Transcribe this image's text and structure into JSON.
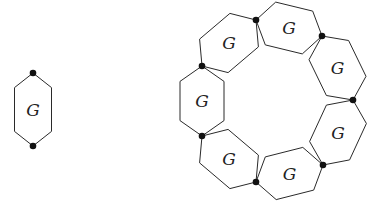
{
  "diagram": {
    "type": "graph-composition",
    "single_block": {
      "label": "G",
      "top_vertex": [
        33,
        73
      ],
      "bottom_vertex": [
        33,
        146
      ],
      "half_width": 18.5
    },
    "ring": {
      "block_label": "G",
      "block_count": 7,
      "half_width": 22,
      "vertices": [
        [
          256,
          20
        ],
        [
          322,
          36
        ],
        [
          353,
          100
        ],
        [
          323,
          165
        ],
        [
          256,
          182
        ],
        [
          202,
          136
        ],
        [
          202,
          66
        ]
      ]
    },
    "colors": {
      "stroke": "#2a2a2a",
      "vertex": "#111111",
      "background": "#ffffff"
    }
  }
}
